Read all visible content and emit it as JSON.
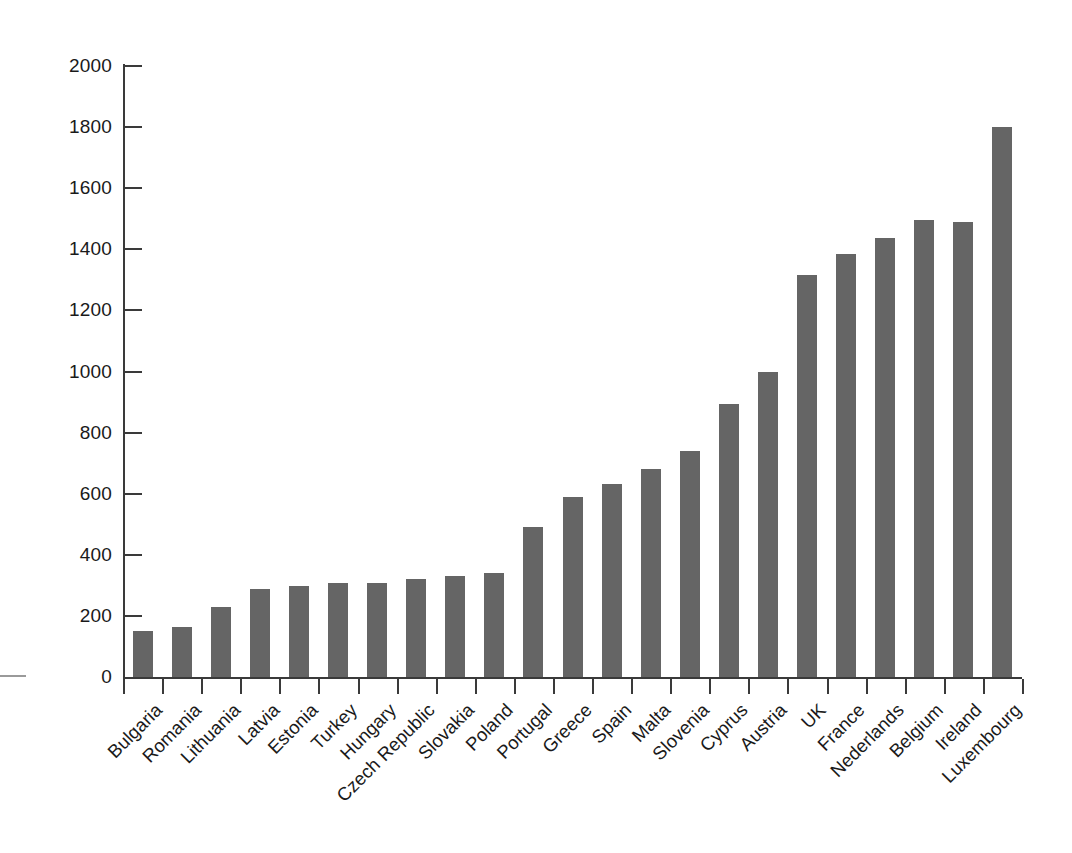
{
  "chart_data": {
    "type": "bar",
    "title": "",
    "subtitle": "",
    "xlabel": "",
    "ylabel": "",
    "ylim": [
      0,
      2000
    ],
    "ytick_step": 200,
    "yticks": [
      0,
      200,
      400,
      600,
      800,
      1000,
      1200,
      1400,
      1600,
      1800,
      2000
    ],
    "ytick_labels": [
      "0",
      "200",
      "400",
      "600",
      "800",
      "1000",
      "1200",
      "1400",
      "1600",
      "1800",
      "2000"
    ],
    "grid": false,
    "legend": null,
    "bar_color": "#656565",
    "axis_color": "#3a3a3a",
    "categories": [
      "Bulgaria",
      "Romania",
      "Lithuania",
      "Latvia",
      "Estonia",
      "Turkey",
      "Hungary",
      "Czech Republic",
      "Slovakia",
      "Poland",
      "Portugal",
      "Greece",
      "Spain",
      "Malta",
      "Slovenia",
      "Cyprus",
      "Austria",
      "UK",
      "France",
      "Nederlands",
      "Belgium",
      "Ireland",
      "Luxembourg"
    ],
    "values": [
      150,
      163,
      228,
      288,
      298,
      308,
      308,
      320,
      330,
      342,
      490,
      590,
      632,
      680,
      740,
      895,
      998,
      1315,
      1385,
      1437,
      1495,
      1490,
      1800
    ]
  }
}
